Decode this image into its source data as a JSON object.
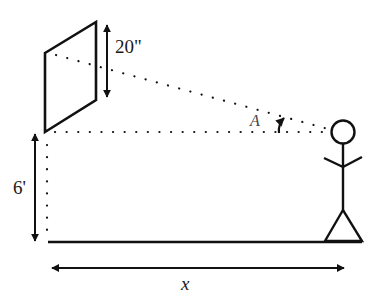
{
  "diagram": {
    "labels": {
      "screen_height": "20\"",
      "mount_height": "6'",
      "angle": "A",
      "distance": "x"
    },
    "colors": {
      "stroke": "#111111",
      "background": "#ffffff"
    }
  }
}
